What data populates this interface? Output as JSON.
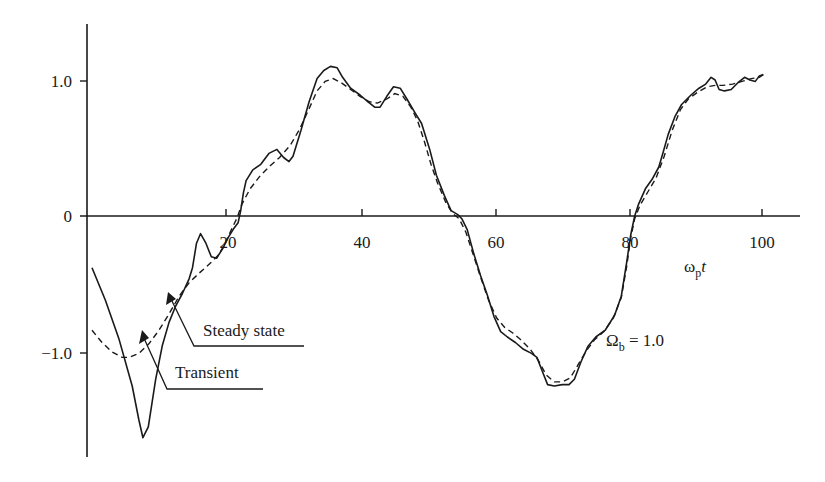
{
  "chart_data": {
    "type": "line",
    "title": "",
    "xlabel": "ωpt",
    "xlabel_main": "ω",
    "xlabel_sub": "p",
    "xlabel_tail": "t",
    "ylabel": "",
    "xlim": [
      0,
      106
    ],
    "ylim": [
      -1.8,
      1.4
    ],
    "grid": false,
    "legend_position": "none",
    "x_ticks": [
      20,
      40,
      60,
      80,
      100
    ],
    "x_tick_labels": [
      "20",
      "40",
      "60",
      "80",
      "100"
    ],
    "y_ticks": [
      1.0,
      0,
      -1.0
    ],
    "y_tick_labels": [
      "1.0",
      "0",
      "−1.0"
    ],
    "annotations": [
      {
        "text": "Steady state",
        "points_to": [
          15.5,
          -0.43
        ]
      },
      {
        "text": "Transient",
        "points_to": [
          11.5,
          -0.75
        ]
      },
      {
        "text": "Ωb = 1.0",
        "main": "Ω",
        "sub": "b",
        "tail": " = 1.0"
      }
    ],
    "series": [
      {
        "name": "Transient",
        "style": "solid",
        "points": [
          [
            0,
            -0.38
          ],
          [
            2,
            -0.62
          ],
          [
            4,
            -0.9
          ],
          [
            6,
            -1.25
          ],
          [
            7,
            -1.5
          ],
          [
            7.6,
            -1.63
          ],
          [
            8.4,
            -1.55
          ],
          [
            9.5,
            -1.2
          ],
          [
            10.5,
            -0.95
          ],
          [
            11.5,
            -0.78
          ],
          [
            12.5,
            -0.66
          ],
          [
            13.5,
            -0.57
          ],
          [
            14.5,
            -0.46
          ],
          [
            15.0,
            -0.38
          ],
          [
            15.6,
            -0.2
          ],
          [
            16.2,
            -0.13
          ],
          [
            17.0,
            -0.2
          ],
          [
            17.8,
            -0.3
          ],
          [
            18.6,
            -0.31
          ],
          [
            19.5,
            -0.24
          ],
          [
            20.3,
            -0.16
          ],
          [
            21.2,
            -0.09
          ],
          [
            21.8,
            -0.05
          ],
          [
            22.2,
            0.04
          ],
          [
            22.6,
            0.17
          ],
          [
            23.0,
            0.26
          ],
          [
            24.0,
            0.34
          ],
          [
            25.2,
            0.38
          ],
          [
            26.4,
            0.46
          ],
          [
            27.6,
            0.49
          ],
          [
            28.6,
            0.43
          ],
          [
            29.4,
            0.4
          ],
          [
            30.0,
            0.44
          ],
          [
            31.2,
            0.63
          ],
          [
            32.4,
            0.84
          ],
          [
            33.6,
            1.01
          ],
          [
            34.6,
            1.07
          ],
          [
            35.6,
            1.1
          ],
          [
            36.6,
            1.09
          ],
          [
            37.4,
            1.02
          ],
          [
            38.6,
            0.94
          ],
          [
            40.0,
            0.89
          ],
          [
            41.2,
            0.84
          ],
          [
            42.2,
            0.8
          ],
          [
            43.0,
            0.8
          ],
          [
            44.0,
            0.88
          ],
          [
            45.0,
            0.95
          ],
          [
            46.0,
            0.94
          ],
          [
            47.0,
            0.86
          ],
          [
            48.2,
            0.76
          ],
          [
            49.2,
            0.68
          ],
          [
            50.4,
            0.49
          ],
          [
            51.4,
            0.3
          ],
          [
            52.6,
            0.15
          ],
          [
            53.6,
            0.04
          ],
          [
            54.6,
            0.01
          ],
          [
            55.2,
            -0.02
          ],
          [
            56.0,
            -0.1
          ],
          [
            57.0,
            -0.28
          ],
          [
            58.0,
            -0.44
          ],
          [
            59.0,
            -0.58
          ],
          [
            60.0,
            -0.74
          ],
          [
            61.0,
            -0.85
          ],
          [
            62.0,
            -0.89
          ],
          [
            63.2,
            -0.93
          ],
          [
            64.4,
            -0.98
          ],
          [
            65.6,
            -1.01
          ],
          [
            66.4,
            -1.04
          ],
          [
            67.2,
            -1.14
          ],
          [
            68.0,
            -1.24
          ],
          [
            69.0,
            -1.25
          ],
          [
            70.2,
            -1.24
          ],
          [
            71.2,
            -1.24
          ],
          [
            72.0,
            -1.2
          ],
          [
            73.0,
            -1.07
          ],
          [
            74.0,
            -0.96
          ],
          [
            75.2,
            -0.89
          ],
          [
            76.6,
            -0.84
          ],
          [
            78.0,
            -0.73
          ],
          [
            79.0,
            -0.59
          ],
          [
            79.8,
            -0.34
          ],
          [
            80.4,
            -0.14
          ],
          [
            81.0,
            0.0
          ],
          [
            81.6,
            0.09
          ],
          [
            82.6,
            0.2
          ],
          [
            83.6,
            0.27
          ],
          [
            84.6,
            0.36
          ],
          [
            85.2,
            0.46
          ],
          [
            86.0,
            0.6
          ],
          [
            87.0,
            0.73
          ],
          [
            88.0,
            0.82
          ],
          [
            89.4,
            0.89
          ],
          [
            90.6,
            0.94
          ],
          [
            91.6,
            0.97
          ],
          [
            92.4,
            1.02
          ],
          [
            93.0,
            1.0
          ],
          [
            93.6,
            0.93
          ],
          [
            94.4,
            0.92
          ],
          [
            95.4,
            0.93
          ],
          [
            96.4,
            0.98
          ],
          [
            97.4,
            1.02
          ],
          [
            98.2,
            1.0
          ],
          [
            99.0,
            0.99
          ],
          [
            99.6,
            1.03
          ],
          [
            100.2,
            1.04
          ]
        ]
      },
      {
        "name": "Steady state",
        "style": "dashed",
        "points": [
          [
            0,
            -0.84
          ],
          [
            1.5,
            -0.93
          ],
          [
            3.0,
            -1.0
          ],
          [
            4.5,
            -1.04
          ],
          [
            5.5,
            -1.04
          ],
          [
            7.0,
            -1.01
          ],
          [
            8.5,
            -0.94
          ],
          [
            10.0,
            -0.84
          ],
          [
            11.5,
            -0.72
          ],
          [
            13.0,
            -0.59
          ],
          [
            14.5,
            -0.49
          ],
          [
            16.0,
            -0.42
          ],
          [
            17.6,
            -0.35
          ],
          [
            18.8,
            -0.29
          ],
          [
            19.8,
            -0.21
          ],
          [
            20.8,
            -0.1
          ],
          [
            21.6,
            -0.02
          ],
          [
            22.4,
            0.09
          ],
          [
            23.6,
            0.2
          ],
          [
            25.0,
            0.29
          ],
          [
            26.6,
            0.37
          ],
          [
            28.0,
            0.43
          ],
          [
            29.6,
            0.52
          ],
          [
            31.0,
            0.64
          ],
          [
            32.4,
            0.79
          ],
          [
            33.6,
            0.92
          ],
          [
            34.8,
            0.99
          ],
          [
            36.0,
            1.01
          ],
          [
            37.2,
            0.98
          ],
          [
            38.6,
            0.93
          ],
          [
            40.0,
            0.88
          ],
          [
            41.4,
            0.84
          ],
          [
            42.6,
            0.83
          ],
          [
            44.0,
            0.86
          ],
          [
            45.2,
            0.9
          ],
          [
            46.4,
            0.88
          ],
          [
            47.6,
            0.8
          ],
          [
            48.6,
            0.7
          ],
          [
            49.6,
            0.55
          ],
          [
            50.6,
            0.38
          ],
          [
            51.6,
            0.24
          ],
          [
            52.8,
            0.1
          ],
          [
            53.8,
            0.02
          ],
          [
            54.8,
            -0.02
          ],
          [
            55.8,
            -0.12
          ],
          [
            56.8,
            -0.27
          ],
          [
            58.0,
            -0.45
          ],
          [
            59.2,
            -0.62
          ],
          [
            60.4,
            -0.75
          ],
          [
            61.6,
            -0.82
          ],
          [
            62.8,
            -0.86
          ],
          [
            64.0,
            -0.91
          ],
          [
            65.4,
            -0.98
          ],
          [
            66.6,
            -1.06
          ],
          [
            67.8,
            -1.17
          ],
          [
            69.0,
            -1.22
          ],
          [
            70.2,
            -1.22
          ],
          [
            71.4,
            -1.19
          ],
          [
            72.6,
            -1.09
          ],
          [
            73.8,
            -0.99
          ],
          [
            75.0,
            -0.91
          ],
          [
            76.4,
            -0.85
          ],
          [
            77.8,
            -0.75
          ],
          [
            79.0,
            -0.6
          ],
          [
            79.8,
            -0.37
          ],
          [
            80.4,
            -0.16
          ],
          [
            81.0,
            -0.02
          ],
          [
            81.8,
            0.08
          ],
          [
            83.0,
            0.18
          ],
          [
            84.2,
            0.28
          ],
          [
            85.4,
            0.44
          ],
          [
            86.6,
            0.63
          ],
          [
            87.8,
            0.78
          ],
          [
            89.0,
            0.86
          ],
          [
            90.4,
            0.91
          ],
          [
            91.8,
            0.95
          ],
          [
            93.0,
            0.96
          ],
          [
            94.2,
            0.96
          ],
          [
            95.6,
            0.97
          ],
          [
            97.0,
            0.99
          ],
          [
            98.4,
            1.01
          ],
          [
            99.6,
            1.02
          ],
          [
            100.2,
            1.04
          ]
        ]
      }
    ],
    "colors": {
      "line": "#1a1a1a",
      "axis": "#1a1a1a",
      "background": "#ffffff"
    }
  }
}
